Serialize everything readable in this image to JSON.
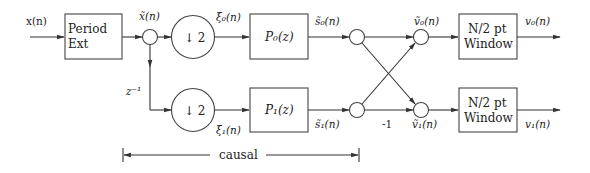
{
  "diagram": {
    "input_label": "x(n)",
    "blocks": {
      "period_ext": {
        "line1": "Period",
        "line2": "Ext"
      },
      "downsample_top": "↓ 2",
      "downsample_bottom": "↓ 2",
      "filter_top": "P₀(z)",
      "filter_bottom": "P₁(z)",
      "window_top": {
        "line1": "N/2 pt",
        "line2": "Window"
      },
      "window_bottom": {
        "line1": "N/2 pt",
        "line2": "Window"
      }
    },
    "signals": {
      "x_tilde": "x̃(n)",
      "xi0": "ξ₀(n)",
      "xi1": "ξ₁(n)",
      "s0": "s̃₀(n)",
      "s1": "s̃₁(n)",
      "v0_tilde": "ṽ₀(n)",
      "v1_tilde": "ṽ₁(n)",
      "v0": "v₀(n)",
      "v1": "v₁(n)"
    },
    "delay_label": "z⁻¹",
    "gain_label": "-1",
    "causal_label": "causal"
  }
}
